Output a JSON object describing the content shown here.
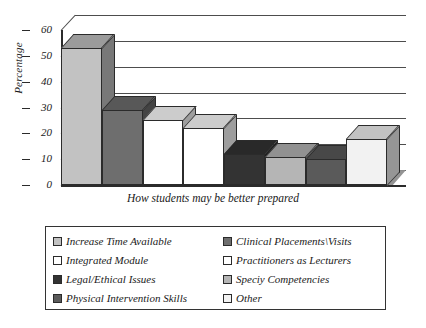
{
  "chart_data": {
    "type": "bar",
    "title": "",
    "subtitle": "",
    "xlabel": "How students may be better prepared",
    "ylabel": "Percentage",
    "ylim": [
      0,
      60
    ],
    "yticks": [
      0,
      10,
      20,
      30,
      40,
      50,
      60
    ],
    "grid": true,
    "legend_position": "bottom",
    "style": "3d-bar",
    "categories": [
      "Increase Time Available",
      "Clinical Placements\\Visits",
      "Integrated Module",
      "Practitioners as Lecturers",
      "Legal/Ethical Issues",
      "Speciy Competencies",
      "Physical Intervention Skills",
      "Other"
    ],
    "values": [
      53,
      29,
      25,
      22,
      12,
      11,
      10,
      18
    ],
    "colors": [
      "#c2c2c2",
      "#6e6e6e",
      "#ffffff",
      "#ffffff",
      "#333333",
      "#b5b5b5",
      "#5a5a5a",
      "#f2f2f2"
    ],
    "series": [
      {
        "name": "Percentage",
        "values": [
          53,
          29,
          25,
          22,
          12,
          11,
          10,
          18
        ]
      }
    ]
  },
  "axis": {
    "y_tick_labels": [
      "60",
      "50",
      "40",
      "30",
      "20",
      "10",
      "0"
    ],
    "y_title": "Percentage",
    "x_title": "How students may be better prepared"
  },
  "legend": {
    "entries": [
      {
        "label": "Increase Time Available",
        "color": "#c2c2c2"
      },
      {
        "label": "Clinical Placements\\Visits",
        "color": "#6e6e6e"
      },
      {
        "label": "Integrated Module",
        "color": "#ffffff"
      },
      {
        "label": "Practitioners as Lecturers",
        "color": "#ffffff"
      },
      {
        "label": "Legal/Ethical Issues",
        "color": "#333333"
      },
      {
        "label": "Speciy Competencies",
        "color": "#b5b5b5"
      },
      {
        "label": "Physical Intervention Skills",
        "color": "#5a5a5a"
      },
      {
        "label": "Other",
        "color": "#f2f2f2"
      }
    ]
  },
  "colors": {
    "axis": "#2b2b2b",
    "gridline": "#4d4d4d",
    "floor": "#8e8e8e",
    "background": "#ffffff",
    "legend_border": "#333333"
  }
}
